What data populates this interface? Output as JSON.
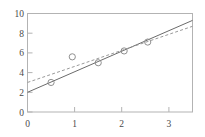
{
  "chart_data": {
    "type": "scatter",
    "title": "",
    "xlabel": "",
    "ylabel": "",
    "xlim": [
      0,
      3.5
    ],
    "ylim": [
      0,
      10
    ],
    "grid": false,
    "legend": "none",
    "xticks": [
      0,
      1,
      2,
      3
    ],
    "yticks": [
      0,
      2,
      4,
      6,
      8,
      10
    ],
    "xtick_labels": [
      "0",
      "1",
      "2",
      "3"
    ],
    "ytick_labels": [
      "0",
      "2",
      "4",
      "6",
      "8",
      "10"
    ],
    "points": {
      "name": "observations",
      "marker": "open-circle",
      "color": "#8f8f8f",
      "x": [
        0.5,
        0.95,
        1.5,
        2.05,
        2.55
      ],
      "y": [
        3.0,
        5.6,
        5.0,
        6.2,
        7.1
      ]
    },
    "series": [
      {
        "name": "solid-fit-line",
        "type": "line",
        "style": "solid",
        "color": "#6b6b6b",
        "x": [
          0,
          3.5
        ],
        "y": [
          2.0,
          9.3
        ],
        "slope": 2.086,
        "intercept": 2.0
      },
      {
        "name": "dashed-fit-line",
        "type": "line",
        "style": "dashed",
        "color": "#9a9a9a",
        "x": [
          0,
          3.5
        ],
        "y": [
          3.0,
          8.7
        ],
        "slope": 1.629,
        "intercept": 3.0
      }
    ],
    "frame": {
      "color": "#b0b0b0",
      "tick_direction": "in"
    }
  }
}
